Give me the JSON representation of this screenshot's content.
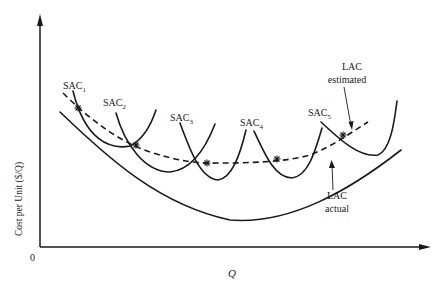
{
  "figure": {
    "axes": {
      "y_label": "Cost per Unit ($/Q)",
      "x_label": "Q",
      "origin_label": "0"
    },
    "short_run_curves": [
      {
        "id": "sac1",
        "label": "SAC",
        "subscript": "1"
      },
      {
        "id": "sac2",
        "label": "SAC",
        "subscript": "2"
      },
      {
        "id": "sac3",
        "label": "SAC",
        "subscript": "3"
      },
      {
        "id": "sac4",
        "label": "SAC",
        "subscript": "4"
      },
      {
        "id": "sac5",
        "label": "SAC",
        "subscript": "5"
      }
    ],
    "long_run_curves": {
      "estimated": {
        "line1": "LAC",
        "line2": "estimated",
        "style": "dashed"
      },
      "actual": {
        "line1": "LAC",
        "line2": "actual",
        "style": "solid"
      }
    },
    "marker_symbol": "asterisk",
    "colors": {
      "ink": "#1a1a1a",
      "background": "#ffffff"
    }
  }
}
